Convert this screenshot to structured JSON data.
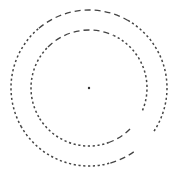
{
  "diagram": {
    "kind": "concentric-dashed-rings",
    "center": {
      "x": 89,
      "y": 88
    },
    "center_dot": {
      "radius": 1.2,
      "color": "#333333"
    },
    "stroke_color": "#444444",
    "rings": [
      {
        "name": "outer",
        "radius": 78,
        "segments": [
          {
            "from_deg": -60,
            "to_deg": 35,
            "style": "dotted"
          },
          {
            "from_deg": 55,
            "to_deg": 75,
            "style": "dashed-long"
          },
          {
            "from_deg": 75,
            "to_deg": 150,
            "style": "dotted"
          },
          {
            "from_deg": 150,
            "to_deg": 230,
            "style": "dotted"
          },
          {
            "from_deg": 230,
            "to_deg": 300,
            "style": "dashed-long"
          }
        ]
      },
      {
        "name": "inner",
        "radius": 58,
        "segments": [
          {
            "from_deg": -65,
            "to_deg": 25,
            "style": "dotted"
          },
          {
            "from_deg": 45,
            "to_deg": 70,
            "style": "dashed-long"
          },
          {
            "from_deg": 70,
            "to_deg": 150,
            "style": "dotted"
          },
          {
            "from_deg": 150,
            "to_deg": 225,
            "style": "dotted"
          },
          {
            "from_deg": 225,
            "to_deg": 295,
            "style": "dashed-long"
          }
        ]
      }
    ],
    "dash_styles": {
      "dotted": "2.2 2.6",
      "dashed-long": "6 4"
    }
  }
}
